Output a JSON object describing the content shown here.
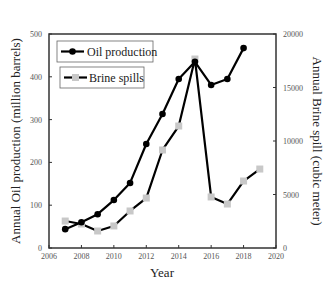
{
  "chart_data": {
    "type": "line",
    "title": "",
    "xlabel": "Year",
    "ylabel": "Annual Oil production (million barrels)",
    "ylabel_right": "Annual Brine spill (cubic meter)",
    "xlim": [
      2006,
      2020
    ],
    "ylim": [
      0,
      500
    ],
    "ylim_right": [
      0,
      20000
    ],
    "x_ticks": [
      "2006",
      "2008",
      "2010",
      "2012",
      "2014",
      "2016",
      "2018",
      "2020"
    ],
    "y_ticks": [
      "0",
      "100",
      "200",
      "300",
      "400",
      "500"
    ],
    "y_ticks_right": [
      "0",
      "5000",
      "10000",
      "15000",
      "20000"
    ],
    "grid": false,
    "legend_position": "upper left",
    "series": [
      {
        "name": "Oil production",
        "axis": "left",
        "marker": "circle",
        "color": "#000000",
        "x": [
          2007,
          2008,
          2009,
          2010,
          2011,
          2012,
          2013,
          2014,
          2015,
          2016,
          2017,
          2018
        ],
        "values": [
          44,
          60,
          79,
          112,
          152,
          243,
          313,
          395,
          435,
          381,
          395,
          467
        ]
      },
      {
        "name": "Brine spills",
        "axis": "right",
        "marker": "square",
        "color": "#000000",
        "marker_color": "#c8c8c8",
        "x": [
          2007,
          2008,
          2009,
          2010,
          2011,
          2012,
          2013,
          2014,
          2015,
          2016,
          2017,
          2018,
          2019
        ],
        "values": [
          2520,
          2240,
          1590,
          2060,
          3460,
          4670,
          9160,
          11400,
          17660,
          4770,
          4110,
          6260,
          7380
        ]
      }
    ]
  },
  "legend": {
    "oil_label": "Oil production",
    "brine_label": "Brine spills"
  },
  "axes": {
    "x_label": "Year",
    "y_left_label": "Annual Oil production (million barrels)",
    "y_right_label": "Annual Brine spill (cubic meter)"
  }
}
